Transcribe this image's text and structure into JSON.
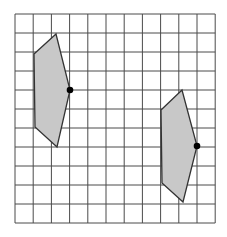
{
  "diagram": {
    "type": "grid-transformation",
    "grid": {
      "columns": 11,
      "rows": 11,
      "x_lines": [
        15,
        33.2,
        51.4,
        69.6,
        87.8,
        106,
        124.2,
        142.4,
        160.6,
        178.8,
        197,
        215.2
      ],
      "y_lines": [
        14,
        33,
        52,
        71,
        90,
        109,
        128,
        147,
        166,
        185,
        204,
        223
      ],
      "line_color": "#4a4a4a"
    },
    "shapes": [
      {
        "name": "left-pentagon",
        "points": [
          [
            34,
            54
          ],
          [
            56,
            34
          ],
          [
            70,
            90
          ],
          [
            57,
            147
          ],
          [
            35,
            127
          ]
        ],
        "fill": "#c8c8c8",
        "stroke": "#333333",
        "marked_vertex": [
          70,
          90
        ]
      },
      {
        "name": "right-pentagon",
        "points": [
          [
            161,
            110
          ],
          [
            182,
            90
          ],
          [
            197,
            146
          ],
          [
            183,
            202
          ],
          [
            162,
            183
          ]
        ],
        "fill": "#c8c8c8",
        "stroke": "#333333",
        "marked_vertex": [
          197,
          146
        ]
      }
    ]
  }
}
